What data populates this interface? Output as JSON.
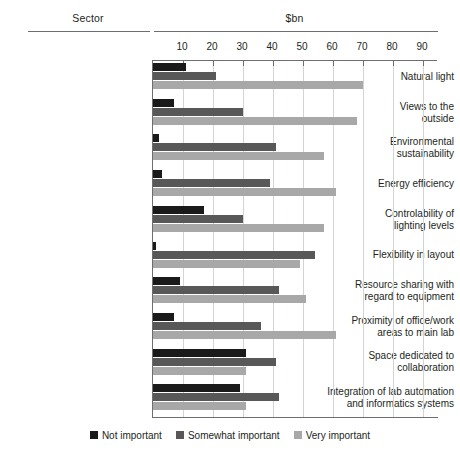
{
  "header": {
    "sector_title": "Sector",
    "unit_title": "$bn"
  },
  "legend": {
    "items": [
      {
        "label": "Not important",
        "color": "#1a1a1a"
      },
      {
        "label": "Somewhat important",
        "color": "#585858"
      },
      {
        "label": "Very important",
        "color": "#a8a8a8"
      }
    ]
  },
  "chart_data": {
    "type": "bar",
    "orientation": "horizontal",
    "title": "",
    "subtitle": "",
    "xlabel": "$bn",
    "ylabel": "Sector",
    "xlim": [
      0,
      95
    ],
    "xticks": [
      10,
      20,
      30,
      40,
      50,
      60,
      70,
      80,
      90
    ],
    "grid": true,
    "legend_position": "bottom-center",
    "categories": [
      "Natural light",
      "Views to the outside",
      "Environmental sustainability",
      "Energy efficiency",
      "Controlability of lighting levels",
      "Flexibility in layout",
      "Resource sharing with regard to equipment",
      "Proximity of office/work areas to main lab",
      "Space dedicated to collaboration",
      "Integration of lab automation and informatics systems"
    ],
    "category_lines": [
      [
        "Natural light"
      ],
      [
        "Views to the",
        "outside"
      ],
      [
        "Environmental",
        "sustainability"
      ],
      [
        "Energy efficiency"
      ],
      [
        "Controlability of",
        "lighting levels"
      ],
      [
        "Flexibility in layout"
      ],
      [
        "Resource sharing with",
        "regard to equipment"
      ],
      [
        "Proximity of office/work",
        "areas to main lab"
      ],
      [
        "Space dedicated to",
        "collaboration"
      ],
      [
        "Integration of lab automation",
        "and informatics systems"
      ]
    ],
    "series": [
      {
        "name": "Not important",
        "color": "#1a1a1a",
        "values": [
          11,
          7,
          2,
          3,
          17,
          1,
          9,
          7,
          31,
          29
        ]
      },
      {
        "name": "Somewhat important",
        "color": "#585858",
        "values": [
          21,
          30,
          41,
          39,
          30,
          54,
          42,
          36,
          41,
          42
        ]
      },
      {
        "name": "Very important",
        "color": "#a8a8a8",
        "values": [
          70,
          68,
          57,
          61,
          57,
          49,
          51,
          61,
          31,
          31
        ]
      }
    ]
  }
}
